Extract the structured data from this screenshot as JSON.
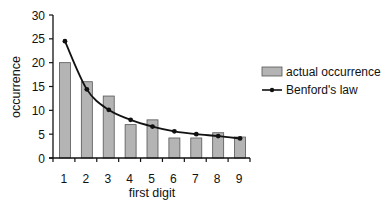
{
  "chart_data": {
    "type": "bar",
    "title": "",
    "xlabel": "first digit",
    "ylabel": "occurrence",
    "categories": [
      "1",
      "2",
      "3",
      "4",
      "5",
      "6",
      "7",
      "8",
      "9"
    ],
    "ylim": [
      0,
      30
    ],
    "yticks": [
      0,
      5,
      10,
      15,
      20,
      25,
      30
    ],
    "grid": false,
    "legend_position": "right",
    "series": [
      {
        "name": "actual occurrence",
        "type": "bar",
        "color": "#b4b4b4",
        "values": [
          20,
          16,
          13,
          7,
          8,
          4.2,
          4.2,
          5.3,
          4.4
        ]
      },
      {
        "name": "Benford's law",
        "type": "line",
        "color": "#111111",
        "marker": "dot",
        "values": [
          24.5,
          14.4,
          10.1,
          8.0,
          6.6,
          5.6,
          5.0,
          4.6,
          4.1
        ]
      }
    ]
  }
}
